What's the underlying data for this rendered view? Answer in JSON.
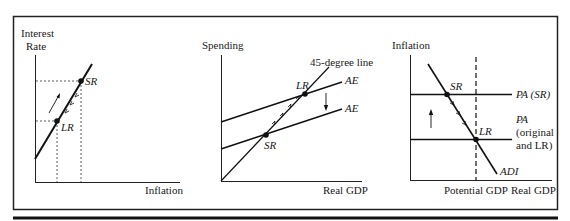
{
  "figure": {
    "panels": [
      {
        "id": "interest-rate-inflation",
        "y_axis_label_line1": "Interest",
        "y_axis_label_line2": "Rate",
        "x_axis_label": "Inflation",
        "points": [
          {
            "label": "SR"
          },
          {
            "label": "LR"
          }
        ]
      },
      {
        "id": "spending-real-gdp",
        "y_axis_label": "Spending",
        "x_axis_label": "Real GDP",
        "line_labels": {
          "forty_five": "45-degree line",
          "ae_upper": "AE",
          "ae_lower": "AE"
        },
        "points": [
          {
            "label": "LR"
          },
          {
            "label": "SR"
          }
        ]
      },
      {
        "id": "inflation-real-gdp",
        "y_axis_label": "Inflation",
        "x_axis_label": "Real GDP",
        "vertical_line_label": "Potential GDP",
        "line_labels": {
          "pa_sr": "PA (SR)",
          "pa_orig_line1": "PA",
          "pa_orig_line2": "(original",
          "pa_orig_line3": "and LR)",
          "adi": "ADI"
        },
        "points": [
          {
            "label": "SR"
          },
          {
            "label": "LR"
          }
        ]
      }
    ]
  }
}
